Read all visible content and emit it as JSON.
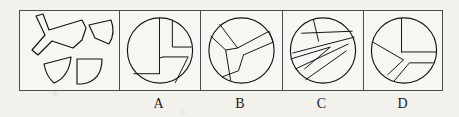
{
  "page": {
    "type": "spatial-reasoning-puzzle",
    "background_color": "#f2f1ec",
    "ink_color": "#121212",
    "frame_color": "#4a4a4a"
  },
  "frame": {
    "panel_count": 5
  },
  "prompt_panel": {
    "name": "scattered-pieces",
    "description": "four separated circle fragments",
    "pieces": [
      {
        "id": "piece-1",
        "description": "y-shaped three-pronged fragment"
      },
      {
        "id": "piece-2",
        "description": "curved wedge fragment"
      },
      {
        "id": "piece-3",
        "description": "narrow crescent fragment"
      },
      {
        "id": "piece-4",
        "description": "quarter-circle fragment with square corner"
      }
    ]
  },
  "options": [
    {
      "id": "option-a",
      "label": "A",
      "description": "circle divided by a vertical line and stepped rectilinear cuts with a small triangular notch at lower right"
    },
    {
      "id": "option-b",
      "label": "B",
      "description": "circle divided by a y-shaped three-pronged band meeting near the centre"
    },
    {
      "id": "option-c",
      "label": "C",
      "description": "circle divided by long parallel diagonal stripes forming an arrow-like zigzag"
    },
    {
      "id": "option-d",
      "label": "D",
      "description": "circle divided into a square quadrant plus angled lower wedges"
    }
  ]
}
